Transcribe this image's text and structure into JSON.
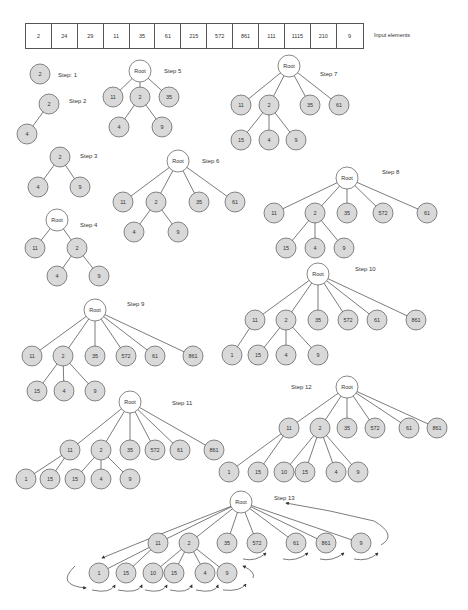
{
  "input": {
    "label": "Input elements",
    "elements": [
      "2",
      "24",
      "29",
      "11",
      "35",
      "61",
      "215",
      "572",
      "861",
      "111",
      "1115",
      "210",
      "9"
    ]
  },
  "colors": {
    "node_fill": "#d9d9d9",
    "root_fill": "#ffffff",
    "stroke": "#555555",
    "edge": "#444444"
  },
  "steps": [
    {
      "label": "Step: 1",
      "lx": 58,
      "ly": 77,
      "nodes": [
        {
          "id": "a",
          "t": "2",
          "x": 40,
          "y": 74
        }
      ],
      "edges": []
    },
    {
      "label": "Step 2",
      "lx": 69,
      "ly": 103,
      "nodes": [
        {
          "id": "a",
          "t": "2",
          "x": 49,
          "y": 104
        },
        {
          "id": "b",
          "t": "4",
          "x": 27,
          "y": 134
        }
      ],
      "edges": [
        [
          "a",
          "b"
        ]
      ]
    },
    {
      "label": "Step 3",
      "lx": 80,
      "ly": 158,
      "nodes": [
        {
          "id": "a",
          "t": "2",
          "x": 60,
          "y": 157
        },
        {
          "id": "b",
          "t": "4",
          "x": 38,
          "y": 187
        },
        {
          "id": "c",
          "t": "9",
          "x": 80,
          "y": 187
        }
      ],
      "edges": [
        [
          "a",
          "b"
        ],
        [
          "a",
          "c"
        ]
      ]
    },
    {
      "label": "Step 4",
      "lx": 80,
      "ly": 227,
      "nodes": [
        {
          "id": "r",
          "t": "Root",
          "x": 57,
          "y": 220,
          "root": true
        },
        {
          "id": "a",
          "t": "11",
          "x": 35,
          "y": 248
        },
        {
          "id": "b",
          "t": "2",
          "x": 77,
          "y": 248
        },
        {
          "id": "c",
          "t": "4",
          "x": 57,
          "y": 276
        },
        {
          "id": "d",
          "t": "9",
          "x": 99,
          "y": 276
        }
      ],
      "edges": [
        [
          "r",
          "a"
        ],
        [
          "r",
          "b"
        ],
        [
          "b",
          "c"
        ],
        [
          "b",
          "d"
        ]
      ]
    },
    {
      "label": "Step 5",
      "lx": 164,
      "ly": 73,
      "nodes": [
        {
          "id": "r",
          "t": "Root",
          "x": 140,
          "y": 71,
          "root": true
        },
        {
          "id": "a",
          "t": "11",
          "x": 113,
          "y": 97
        },
        {
          "id": "b",
          "t": "2",
          "x": 140,
          "y": 97
        },
        {
          "id": "c",
          "t": "35",
          "x": 169,
          "y": 97
        },
        {
          "id": "d",
          "t": "4",
          "x": 119,
          "y": 127
        },
        {
          "id": "e",
          "t": "9",
          "x": 162,
          "y": 127
        }
      ],
      "edges": [
        [
          "r",
          "a"
        ],
        [
          "r",
          "b"
        ],
        [
          "r",
          "c"
        ],
        [
          "b",
          "d"
        ],
        [
          "b",
          "e"
        ]
      ]
    },
    {
      "label": "Step 6",
      "lx": 202,
      "ly": 163,
      "nodes": [
        {
          "id": "r",
          "t": "Root",
          "x": 178,
          "y": 161,
          "root": true
        },
        {
          "id": "a",
          "t": "11",
          "x": 123,
          "y": 202
        },
        {
          "id": "b",
          "t": "2",
          "x": 156,
          "y": 202
        },
        {
          "id": "c",
          "t": "35",
          "x": 199,
          "y": 202
        },
        {
          "id": "d",
          "t": "61",
          "x": 235,
          "y": 202
        },
        {
          "id": "e",
          "t": "4",
          "x": 134,
          "y": 232
        },
        {
          "id": "f",
          "t": "9",
          "x": 178,
          "y": 232
        }
      ],
      "edges": [
        [
          "r",
          "a"
        ],
        [
          "r",
          "b"
        ],
        [
          "r",
          "c"
        ],
        [
          "r",
          "d"
        ],
        [
          "b",
          "e"
        ],
        [
          "b",
          "f"
        ]
      ]
    },
    {
      "label": "Step 7",
      "lx": 320,
      "ly": 76,
      "nodes": [
        {
          "id": "r",
          "t": "Root",
          "x": 289,
          "y": 66,
          "root": true
        },
        {
          "id": "a",
          "t": "11",
          "x": 241,
          "y": 105
        },
        {
          "id": "b",
          "t": "2",
          "x": 269,
          "y": 105
        },
        {
          "id": "c",
          "t": "35",
          "x": 310,
          "y": 105
        },
        {
          "id": "d",
          "t": "61",
          "x": 339,
          "y": 105
        },
        {
          "id": "e",
          "t": "15",
          "x": 241,
          "y": 140
        },
        {
          "id": "f",
          "t": "4",
          "x": 269,
          "y": 140
        },
        {
          "id": "g",
          "t": "9",
          "x": 296,
          "y": 140
        }
      ],
      "edges": [
        [
          "r",
          "a"
        ],
        [
          "r",
          "b"
        ],
        [
          "r",
          "c"
        ],
        [
          "r",
          "d"
        ],
        [
          "b",
          "e"
        ],
        [
          "b",
          "f"
        ],
        [
          "b",
          "g"
        ]
      ]
    },
    {
      "label": "Step 8",
      "lx": 382,
      "ly": 174,
      "nodes": [
        {
          "id": "r",
          "t": "Root",
          "x": 347,
          "y": 178,
          "root": true
        },
        {
          "id": "a",
          "t": "11",
          "x": 274,
          "y": 213
        },
        {
          "id": "b",
          "t": "2",
          "x": 315,
          "y": 213
        },
        {
          "id": "c",
          "t": "35",
          "x": 347,
          "y": 213
        },
        {
          "id": "d",
          "t": "572",
          "x": 383,
          "y": 213
        },
        {
          "id": "e",
          "t": "61",
          "x": 427,
          "y": 213
        },
        {
          "id": "f",
          "t": "15",
          "x": 286,
          "y": 248
        },
        {
          "id": "g",
          "t": "4",
          "x": 315,
          "y": 248
        },
        {
          "id": "h",
          "t": "9",
          "x": 344,
          "y": 248
        }
      ],
      "edges": [
        [
          "r",
          "a"
        ],
        [
          "r",
          "b"
        ],
        [
          "r",
          "c"
        ],
        [
          "r",
          "d"
        ],
        [
          "r",
          "e"
        ],
        [
          "b",
          "f"
        ],
        [
          "b",
          "g"
        ],
        [
          "b",
          "h"
        ]
      ]
    },
    {
      "label": "Step 9",
      "lx": 127,
      "ly": 306,
      "nodes": [
        {
          "id": "r",
          "t": "Root",
          "x": 95,
          "y": 310,
          "root": true
        },
        {
          "id": "a",
          "t": "11",
          "x": 32,
          "y": 356
        },
        {
          "id": "b",
          "t": "2",
          "x": 63,
          "y": 356
        },
        {
          "id": "c",
          "t": "35",
          "x": 95,
          "y": 356
        },
        {
          "id": "d",
          "t": "572",
          "x": 126,
          "y": 356
        },
        {
          "id": "e",
          "t": "61",
          "x": 155,
          "y": 356
        },
        {
          "id": "f",
          "t": "861",
          "x": 193,
          "y": 356
        },
        {
          "id": "g",
          "t": "15",
          "x": 37,
          "y": 391
        },
        {
          "id": "h",
          "t": "4",
          "x": 64,
          "y": 391
        },
        {
          "id": "i",
          "t": "9",
          "x": 95,
          "y": 391
        }
      ],
      "edges": [
        [
          "r",
          "a"
        ],
        [
          "r",
          "b"
        ],
        [
          "r",
          "c"
        ],
        [
          "r",
          "d"
        ],
        [
          "r",
          "e"
        ],
        [
          "r",
          "f"
        ],
        [
          "b",
          "g"
        ],
        [
          "b",
          "h"
        ],
        [
          "b",
          "i"
        ]
      ]
    },
    {
      "label": "Step 10",
      "lx": 355,
      "ly": 271,
      "nodes": [
        {
          "id": "r",
          "t": "Root",
          "x": 318,
          "y": 274,
          "root": true
        },
        {
          "id": "a",
          "t": "11",
          "x": 255,
          "y": 320
        },
        {
          "id": "b",
          "t": "2",
          "x": 286,
          "y": 320
        },
        {
          "id": "c",
          "t": "35",
          "x": 318,
          "y": 320
        },
        {
          "id": "d",
          "t": "572",
          "x": 348,
          "y": 320
        },
        {
          "id": "e",
          "t": "61",
          "x": 377,
          "y": 320
        },
        {
          "id": "f",
          "t": "861",
          "x": 416,
          "y": 320
        },
        {
          "id": "g",
          "t": "1",
          "x": 232,
          "y": 355
        },
        {
          "id": "h",
          "t": "15",
          "x": 258,
          "y": 355
        },
        {
          "id": "i",
          "t": "4",
          "x": 286,
          "y": 355
        },
        {
          "id": "j",
          "t": "9",
          "x": 318,
          "y": 355
        }
      ],
      "edges": [
        [
          "r",
          "a"
        ],
        [
          "r",
          "b"
        ],
        [
          "r",
          "c"
        ],
        [
          "r",
          "d"
        ],
        [
          "r",
          "e"
        ],
        [
          "r",
          "f"
        ],
        [
          "a",
          "g"
        ],
        [
          "b",
          "h"
        ],
        [
          "b",
          "i"
        ],
        [
          "b",
          "j"
        ]
      ]
    },
    {
      "label": "Step 11",
      "lx": 172,
      "ly": 405,
      "nodes": [
        {
          "id": "r",
          "t": "Root",
          "x": 130,
          "y": 402,
          "root": true
        },
        {
          "id": "a",
          "t": "11",
          "x": 70,
          "y": 450
        },
        {
          "id": "b",
          "t": "2",
          "x": 101,
          "y": 450
        },
        {
          "id": "c",
          "t": "35",
          "x": 130,
          "y": 450
        },
        {
          "id": "d",
          "t": "572",
          "x": 155,
          "y": 450
        },
        {
          "id": "e",
          "t": "61",
          "x": 180,
          "y": 450
        },
        {
          "id": "f",
          "t": "861",
          "x": 214,
          "y": 450
        },
        {
          "id": "g",
          "t": "1",
          "x": 26,
          "y": 479
        },
        {
          "id": "h",
          "t": "15",
          "x": 50,
          "y": 479
        },
        {
          "id": "i",
          "t": "15",
          "x": 75,
          "y": 479
        },
        {
          "id": "j",
          "t": "4",
          "x": 101,
          "y": 479
        },
        {
          "id": "k",
          "t": "9",
          "x": 130,
          "y": 479
        }
      ],
      "edges": [
        [
          "r",
          "a"
        ],
        [
          "r",
          "b"
        ],
        [
          "r",
          "c"
        ],
        [
          "r",
          "d"
        ],
        [
          "r",
          "e"
        ],
        [
          "r",
          "f"
        ],
        [
          "a",
          "g"
        ],
        [
          "a",
          "h"
        ],
        [
          "b",
          "i"
        ],
        [
          "b",
          "j"
        ],
        [
          "b",
          "k"
        ]
      ]
    },
    {
      "label": "Step 12",
      "lx": 291,
      "ly": 389,
      "nodes": [
        {
          "id": "r",
          "t": "Root",
          "x": 347,
          "y": 387,
          "root": true
        },
        {
          "id": "a",
          "t": "11",
          "x": 289,
          "y": 428
        },
        {
          "id": "b",
          "t": "2",
          "x": 320,
          "y": 428
        },
        {
          "id": "c",
          "t": "35",
          "x": 347,
          "y": 428
        },
        {
          "id": "d",
          "t": "572",
          "x": 375,
          "y": 428
        },
        {
          "id": "e",
          "t": "61",
          "x": 409,
          "y": 428
        },
        {
          "id": "f",
          "t": "861",
          "x": 437,
          "y": 428
        },
        {
          "id": "g",
          "t": "1",
          "x": 229,
          "y": 472
        },
        {
          "id": "h",
          "t": "15",
          "x": 258,
          "y": 472
        },
        {
          "id": "i",
          "t": "10",
          "x": 284,
          "y": 472
        },
        {
          "id": "j",
          "t": "15",
          "x": 305,
          "y": 472
        },
        {
          "id": "k",
          "t": "4",
          "x": 336,
          "y": 472
        },
        {
          "id": "l",
          "t": "9",
          "x": 358,
          "y": 472
        }
      ],
      "edges": [
        [
          "r",
          "a"
        ],
        [
          "r",
          "b"
        ],
        [
          "r",
          "c"
        ],
        [
          "r",
          "d"
        ],
        [
          "r",
          "e"
        ],
        [
          "r",
          "f"
        ],
        [
          "a",
          "g"
        ],
        [
          "a",
          "h"
        ],
        [
          "b",
          "i"
        ],
        [
          "b",
          "j"
        ],
        [
          "b",
          "k"
        ],
        [
          "b",
          "l"
        ]
      ]
    },
    {
      "label": "Step 13",
      "lx": 274,
      "ly": 500,
      "nodes": [
        {
          "id": "r",
          "t": "Root",
          "x": 241,
          "y": 502,
          "root": true
        },
        {
          "id": "a",
          "t": "11",
          "x": 158,
          "y": 543
        },
        {
          "id": "b",
          "t": "2",
          "x": 189,
          "y": 543
        },
        {
          "id": "c",
          "t": "35",
          "x": 227,
          "y": 543
        },
        {
          "id": "d",
          "t": "572",
          "x": 257,
          "y": 543
        },
        {
          "id": "e",
          "t": "61",
          "x": 296,
          "y": 543
        },
        {
          "id": "f",
          "t": "861",
          "x": 326,
          "y": 543
        },
        {
          "id": "g",
          "t": "9",
          "x": 361,
          "y": 543
        },
        {
          "id": "h",
          "t": "1",
          "x": 99,
          "y": 573
        },
        {
          "id": "i",
          "t": "15",
          "x": 126,
          "y": 573
        },
        {
          "id": "j",
          "t": "10",
          "x": 153,
          "y": 573
        },
        {
          "id": "k",
          "t": "15",
          "x": 174,
          "y": 573
        },
        {
          "id": "l",
          "t": "4",
          "x": 205,
          "y": 573
        },
        {
          "id": "m",
          "t": "9",
          "x": 227,
          "y": 573
        }
      ],
      "edges": [
        [
          "r",
          "a"
        ],
        [
          "r",
          "b"
        ],
        [
          "r",
          "c"
        ],
        [
          "r",
          "d"
        ],
        [
          "r",
          "e"
        ],
        [
          "r",
          "f"
        ],
        [
          "r",
          "g"
        ],
        [
          "a",
          "h"
        ],
        [
          "a",
          "i"
        ],
        [
          "b",
          "j"
        ],
        [
          "b",
          "k"
        ],
        [
          "b",
          "l"
        ],
        [
          "b",
          "m"
        ]
      ]
    }
  ]
}
